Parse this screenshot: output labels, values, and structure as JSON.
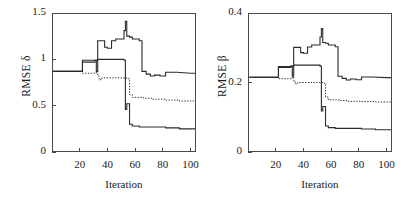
{
  "chart_data": [
    {
      "type": "line",
      "panel": "left",
      "title": "",
      "xlabel": "Iteration",
      "ylabel": "RMSE δ",
      "xlim": [
        0,
        104
      ],
      "ylim": [
        0,
        1.5
      ],
      "xticks": [
        20,
        40,
        60,
        80,
        100
      ],
      "xticklabels": [
        "20",
        "40",
        "60",
        "80",
        "100"
      ],
      "yticks": [
        0,
        0.5,
        1,
        1.5
      ],
      "yticklabels": [
        "0",
        "0.5",
        "1",
        "1.5"
      ],
      "grid": false,
      "legend": "none",
      "series": [
        {
          "name": "upper-solid",
          "style": "solid",
          "x": [
            1,
            12,
            22,
            22,
            31,
            31,
            33,
            33,
            36,
            36,
            38,
            38,
            40,
            40,
            43,
            43,
            46,
            46,
            50,
            50,
            52,
            52,
            53,
            53,
            54,
            54,
            56,
            56,
            58,
            58,
            63,
            63,
            65,
            65,
            68,
            68,
            71,
            71,
            74,
            74,
            78,
            78,
            82,
            82,
            90,
            100,
            104
          ],
          "y": [
            0.87,
            0.87,
            0.87,
            0.97,
            0.97,
            0.99,
            0.99,
            1.2,
            1.2,
            1.2,
            1.2,
            1.13,
            1.13,
            1.12,
            1.12,
            1.2,
            1.2,
            1.22,
            1.22,
            1.22,
            1.22,
            1.31,
            1.31,
            1.41,
            1.41,
            1.25,
            1.25,
            1.24,
            1.24,
            1.22,
            1.22,
            1.2,
            1.2,
            0.87,
            0.87,
            0.84,
            0.84,
            0.82,
            0.82,
            0.83,
            0.83,
            0.82,
            0.82,
            0.86,
            0.86,
            0.85,
            0.85
          ]
        },
        {
          "name": "lower-solid",
          "style": "solid",
          "x": [
            1,
            12,
            22,
            22,
            31,
            31,
            32,
            32,
            33,
            33,
            34,
            34,
            52,
            52,
            53,
            53,
            54,
            54,
            56,
            56,
            58,
            58,
            63,
            63,
            70,
            70,
            82,
            82,
            92,
            92,
            100,
            104
          ],
          "y": [
            0.87,
            0.87,
            0.87,
            0.99,
            0.99,
            0.99,
            0.99,
            0.87,
            0.87,
            1.0,
            1.0,
            1.0,
            1.0,
            0.99,
            0.99,
            0.46,
            0.46,
            0.52,
            0.52,
            0.3,
            0.3,
            0.28,
            0.28,
            0.27,
            0.27,
            0.27,
            0.27,
            0.26,
            0.26,
            0.25,
            0.25,
            0.25
          ]
        },
        {
          "name": "dotted",
          "style": "dotted",
          "x": [
            1,
            12,
            22,
            22,
            30,
            30,
            32,
            32,
            33,
            33,
            34,
            34,
            36,
            36,
            50,
            50,
            54,
            54,
            56,
            56,
            58,
            58,
            66,
            66,
            72,
            72,
            82,
            82,
            92,
            92,
            100,
            104
          ],
          "y": [
            0.87,
            0.87,
            0.87,
            0.85,
            0.85,
            0.85,
            0.85,
            0.87,
            0.87,
            0.82,
            0.82,
            0.78,
            0.78,
            0.8,
            0.8,
            0.8,
            0.8,
            0.79,
            0.79,
            0.62,
            0.62,
            0.59,
            0.59,
            0.58,
            0.58,
            0.57,
            0.57,
            0.56,
            0.56,
            0.55,
            0.55,
            0.55
          ]
        }
      ]
    },
    {
      "type": "line",
      "panel": "right",
      "title": "",
      "xlabel": "Iteration",
      "ylabel": "RMSE β",
      "xlim": [
        0,
        104
      ],
      "ylim": [
        0,
        0.4
      ],
      "xticks": [
        20,
        40,
        60,
        80,
        100
      ],
      "xticklabels": [
        "20",
        "40",
        "60",
        "80",
        "100"
      ],
      "yticks": [
        0,
        0.2,
        0.4
      ],
      "yticklabels": [
        "0",
        "0.2",
        "0.4"
      ],
      "grid": false,
      "legend": "none",
      "series": [
        {
          "name": "upper-solid",
          "style": "solid",
          "x": [
            1,
            12,
            22,
            22,
            31,
            31,
            33,
            33,
            36,
            36,
            38,
            38,
            40,
            40,
            43,
            43,
            46,
            46,
            50,
            50,
            52,
            52,
            53,
            53,
            54,
            54,
            56,
            56,
            58,
            58,
            63,
            63,
            65,
            65,
            68,
            68,
            71,
            71,
            74,
            74,
            78,
            78,
            82,
            82,
            90,
            100,
            104
          ],
          "y": [
            0.215,
            0.215,
            0.215,
            0.243,
            0.243,
            0.248,
            0.248,
            0.301,
            0.301,
            0.301,
            0.301,
            0.286,
            0.286,
            0.284,
            0.284,
            0.302,
            0.302,
            0.308,
            0.308,
            0.308,
            0.308,
            0.331,
            0.331,
            0.355,
            0.355,
            0.315,
            0.315,
            0.313,
            0.313,
            0.308,
            0.308,
            0.303,
            0.303,
            0.218,
            0.218,
            0.212,
            0.212,
            0.207,
            0.207,
            0.21,
            0.21,
            0.208,
            0.208,
            0.216,
            0.216,
            0.214,
            0.214
          ]
        },
        {
          "name": "lower-solid",
          "style": "solid",
          "x": [
            1,
            12,
            22,
            22,
            31,
            31,
            32,
            32,
            33,
            33,
            34,
            34,
            52,
            52,
            53,
            53,
            54,
            54,
            56,
            56,
            58,
            58,
            63,
            63,
            70,
            70,
            82,
            82,
            92,
            92,
            100,
            104
          ],
          "y": [
            0.215,
            0.215,
            0.215,
            0.246,
            0.246,
            0.246,
            0.246,
            0.218,
            0.218,
            0.25,
            0.25,
            0.25,
            0.25,
            0.247,
            0.247,
            0.118,
            0.118,
            0.131,
            0.131,
            0.075,
            0.075,
            0.07,
            0.07,
            0.068,
            0.068,
            0.068,
            0.068,
            0.066,
            0.066,
            0.064,
            0.064,
            0.064
          ]
        },
        {
          "name": "dotted",
          "style": "dotted",
          "x": [
            1,
            12,
            22,
            22,
            30,
            30,
            32,
            32,
            33,
            33,
            34,
            34,
            36,
            36,
            50,
            50,
            54,
            54,
            56,
            56,
            58,
            58,
            66,
            66,
            72,
            72,
            82,
            82,
            92,
            92,
            100,
            104
          ],
          "y": [
            0.215,
            0.215,
            0.215,
            0.211,
            0.211,
            0.211,
            0.211,
            0.216,
            0.216,
            0.205,
            0.205,
            0.196,
            0.196,
            0.2,
            0.2,
            0.2,
            0.2,
            0.198,
            0.198,
            0.158,
            0.158,
            0.15,
            0.15,
            0.148,
            0.148,
            0.146,
            0.146,
            0.145,
            0.145,
            0.144,
            0.144,
            0.144
          ]
        }
      ]
    }
  ],
  "style": {
    "axis_color": "#4a4a4a",
    "line_color": "#2b2b2b",
    "background": "#ffffff"
  }
}
